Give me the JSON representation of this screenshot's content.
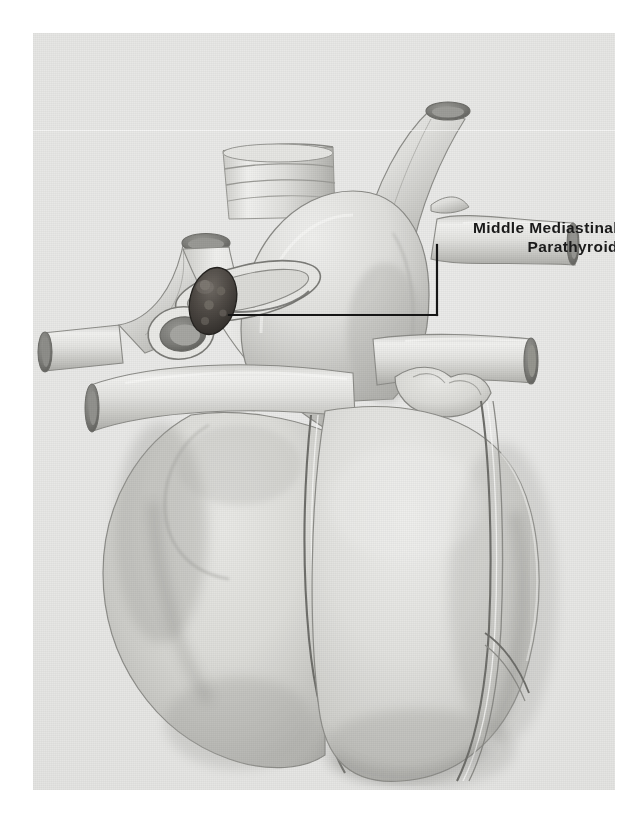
{
  "figure": {
    "medium": "pencil-and-wash anatomical illustration (halftone scan)",
    "background_color": "#e7e7e5",
    "ink_color": "#1a1a1a"
  },
  "label": {
    "line1": "Middle  Mediastinal",
    "line2": "Parathyroid"
  },
  "leader": {
    "description": "right-angle pointer line from the label down and left to the dark parathyroid nodule",
    "color": "#151515"
  },
  "structures": [
    {
      "name": "right-brachiocephalic-vein-stump",
      "label": ""
    },
    {
      "name": "left-brachiocephalic-vein-stump",
      "label": ""
    },
    {
      "name": "trachea-stump",
      "label": ""
    },
    {
      "name": "aortic-arch",
      "label": ""
    },
    {
      "name": "superior-vena-cava",
      "label": ""
    },
    {
      "name": "pulmonary-trunk",
      "label": ""
    },
    {
      "name": "right-atrium",
      "label": ""
    },
    {
      "name": "right-ventricle",
      "label": ""
    },
    {
      "name": "left-ventricle",
      "label": ""
    },
    {
      "name": "left-atrial-appendage",
      "label": ""
    },
    {
      "name": "coronary-artery-groove",
      "label": ""
    },
    {
      "name": "parathyroid-gland-nodule",
      "label": ""
    }
  ]
}
